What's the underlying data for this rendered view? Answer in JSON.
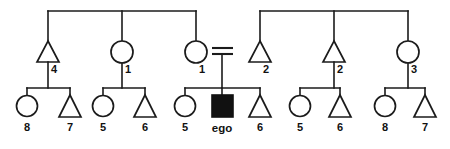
{
  "diagram": {
    "type": "pedigree-chart",
    "width": 450,
    "height": 149,
    "colors": {
      "line": "#1b1b1b",
      "symbol_fill": "#ffffff",
      "proband_fill": "#111111",
      "background": "#ffffff",
      "label": "#111111"
    },
    "legend": {
      "circle_meaning": "female",
      "triangle_meaning": "male",
      "filled_square_meaning": "ego (proband)",
      "equals_meaning": "marriage / mating"
    }
  },
  "generation_two": {
    "label": "parents generation",
    "members": [
      {
        "id": "g2-1",
        "shape": "triangle",
        "sex": "male",
        "label": "4",
        "cx": 48,
        "cy": 52
      },
      {
        "id": "g2-2",
        "shape": "circle",
        "sex": "female",
        "label": "1",
        "cx": 122,
        "cy": 52
      },
      {
        "id": "g2-3",
        "shape": "circle",
        "sex": "female",
        "label": "1",
        "cx": 196,
        "cy": 52
      },
      {
        "id": "g2-4",
        "shape": "triangle",
        "sex": "male",
        "label": "2",
        "cx": 260,
        "cy": 52
      },
      {
        "id": "g2-5",
        "shape": "triangle",
        "sex": "male",
        "label": "2",
        "cx": 334,
        "cy": 52
      },
      {
        "id": "g2-6",
        "shape": "circle",
        "sex": "female",
        "label": "3",
        "cx": 408,
        "cy": 52
      }
    ]
  },
  "generation_three": {
    "label": "ego generation",
    "members": [
      {
        "id": "g3-1",
        "shape": "circle",
        "sex": "female",
        "label": "8",
        "cx": 27,
        "cy": 106
      },
      {
        "id": "g3-2",
        "shape": "triangle",
        "sex": "male",
        "label": "7",
        "cx": 70,
        "cy": 106
      },
      {
        "id": "g3-3",
        "shape": "circle",
        "sex": "female",
        "label": "5",
        "cx": 103,
        "cy": 106
      },
      {
        "id": "g3-4",
        "shape": "triangle",
        "sex": "male",
        "label": "6",
        "cx": 145,
        "cy": 106
      },
      {
        "id": "g3-5",
        "shape": "circle",
        "sex": "female",
        "label": "5",
        "cx": 185,
        "cy": 106
      },
      {
        "id": "g3-6",
        "shape": "square",
        "sex": "ego",
        "label": "ego",
        "cx": 222,
        "cy": 106
      },
      {
        "id": "g3-7",
        "shape": "triangle",
        "sex": "male",
        "label": "6",
        "cx": 260,
        "cy": 106
      },
      {
        "id": "g3-8",
        "shape": "circle",
        "sex": "female",
        "label": "5",
        "cx": 300,
        "cy": 106
      },
      {
        "id": "g3-9",
        "shape": "triangle",
        "sex": "male",
        "label": "6",
        "cx": 340,
        "cy": 106
      },
      {
        "id": "g3-10",
        "shape": "circle",
        "sex": "female",
        "label": "8",
        "cx": 385,
        "cy": 106
      },
      {
        "id": "g3-11",
        "shape": "triangle",
        "sex": "male",
        "label": "7",
        "cx": 425,
        "cy": 106
      }
    ]
  },
  "connectors": {
    "sibship_top_left": {
      "y": 11,
      "x1": 48,
      "x2": 196
    },
    "sibship_top_right": {
      "y": 11,
      "x1": 260,
      "x2": 408
    },
    "mating": {
      "x1": 212,
      "x2": 233,
      "y_upper": 48,
      "y_lower": 54
    },
    "sibship_bars": [
      {
        "id": "sib-a",
        "y": 88,
        "x1": 27,
        "x2": 70
      },
      {
        "id": "sib-b",
        "y": 88,
        "x1": 103,
        "x2": 145
      },
      {
        "id": "sib-c",
        "y": 88,
        "x1": 185,
        "x2": 260
      },
      {
        "id": "sib-d",
        "y": 88,
        "x1": 300,
        "x2": 340
      },
      {
        "id": "sib-e",
        "y": 88,
        "x1": 385,
        "x2": 425
      }
    ]
  }
}
